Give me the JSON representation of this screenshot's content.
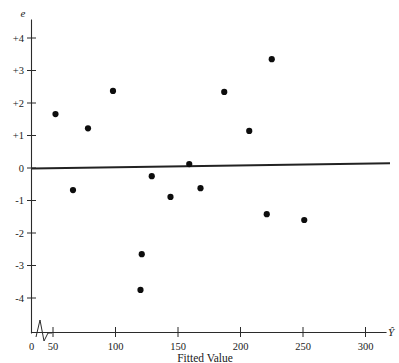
{
  "chart_data": {
    "type": "scatter",
    "title": "",
    "xlabel": "Fitted Value",
    "ylabel": "e",
    "x_axis_symbol": "Ŷ",
    "y_axis_symbol": "e",
    "xlim": [
      0,
      320
    ],
    "ylim": [
      -4.6,
      4.6
    ],
    "grid": false,
    "legend": null,
    "x_ticks": [
      0,
      50,
      100,
      150,
      200,
      250,
      300
    ],
    "x_tick_labels": [
      "0",
      "50",
      "100",
      "150",
      "200",
      "250",
      "300"
    ],
    "y_ticks": [
      4,
      3,
      2,
      1,
      0,
      -1,
      -2,
      -3,
      -4
    ],
    "y_tick_labels": [
      "+4",
      "+3",
      "+2",
      "+1",
      "0",
      "-1",
      "-2",
      "-3",
      "-4"
    ],
    "axis_break": true,
    "axis_break_note": "zigzag break on x-axis between 0 and 50",
    "points": [
      {
        "x": 52,
        "y": 1.66
      },
      {
        "x": 66,
        "y": -0.68
      },
      {
        "x": 78,
        "y": 1.22
      },
      {
        "x": 98,
        "y": 2.37
      },
      {
        "x": 120,
        "y": -3.75
      },
      {
        "x": 121,
        "y": -2.65
      },
      {
        "x": 129,
        "y": -0.25
      },
      {
        "x": 144,
        "y": -0.89
      },
      {
        "x": 159,
        "y": 0.12
      },
      {
        "x": 168,
        "y": -0.62
      },
      {
        "x": 187,
        "y": 2.34
      },
      {
        "x": 207,
        "y": 1.14
      },
      {
        "x": 221,
        "y": -1.42
      },
      {
        "x": 225,
        "y": 3.35
      },
      {
        "x": 251,
        "y": -1.6
      }
    ],
    "reference_line": {
      "name": "zero-residual-line",
      "x_start": 5,
      "y_start": -0.02,
      "x_end": 320,
      "y_end": 0.16
    }
  },
  "labels": {
    "x_caption": "Fitted Value",
    "y_symbol": "e",
    "x_symbol": "Ŷ"
  },
  "colors": {
    "point": "#0d0d0d",
    "axis": "#2b2b2b",
    "line": "#222222",
    "background": "#ffffff"
  }
}
